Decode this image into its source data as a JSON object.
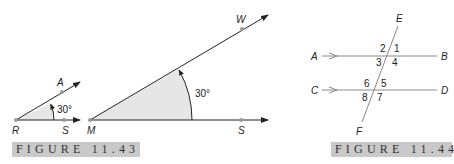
{
  "figure_11_43": {
    "left_angle": {
      "vertex": "R",
      "ray_point": "A",
      "base_point": "S",
      "angle": "30°"
    },
    "right_angle": {
      "vertex": "M",
      "ray_point": "W",
      "base_point": "S",
      "angle": "30°"
    },
    "caption": "FIGURE 11.43"
  },
  "figure_11_44": {
    "lines": {
      "top_left": "A",
      "top_right": "B",
      "bottom_left": "C",
      "bottom_right": "D",
      "transversal_top": "E",
      "transversal_bottom": "F"
    },
    "angles": [
      "1",
      "2",
      "3",
      "4",
      "5",
      "6",
      "7",
      "8"
    ],
    "caption": "FIGURE 11.44"
  },
  "colors": {
    "line": "#222222",
    "shade": "#e6e6e6",
    "point": "#9a9a9a",
    "parallel_line": "#8a8a8a",
    "caption_bg": "#c9c9c9"
  }
}
